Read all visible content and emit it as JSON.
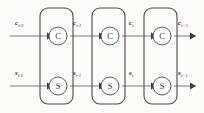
{
  "figure": {
    "type": "unrolled-recurrent-network-diagram",
    "background_color": "#fbfbfa",
    "stroke_color": "#4a4a4a",
    "wire_color": "#7d7d7d",
    "label_color": "#1c1c1c"
  },
  "blocks": [
    {
      "id": "timestep-block-1",
      "nodes": [
        {
          "id": "c-node-1",
          "label": "C",
          "row": "top"
        },
        {
          "id": "s-node-1",
          "label": "S",
          "row": "bottom"
        }
      ]
    },
    {
      "id": "timestep-block-2",
      "nodes": [
        {
          "id": "c-node-2",
          "label": "C",
          "row": "top"
        },
        {
          "id": "s-node-2",
          "label": "S",
          "row": "bottom"
        }
      ]
    },
    {
      "id": "timestep-block-3",
      "nodes": [
        {
          "id": "c-node-3",
          "label": "C",
          "row": "top"
        },
        {
          "id": "s-node-3",
          "label": "S",
          "row": "bottom"
        }
      ]
    }
  ],
  "labels": {
    "top_row": [
      {
        "id": "c-label-0",
        "base": "c",
        "sub": "t-2"
      },
      {
        "id": "c-label-1",
        "base": "c",
        "sub": "t-1"
      },
      {
        "id": "c-label-2",
        "base": "c",
        "sub": "t"
      },
      {
        "id": "c-label-3",
        "base": "c",
        "sub": "t+1"
      }
    ],
    "bottom_row": [
      {
        "id": "s-label-0",
        "base": "s",
        "sub": "t-2"
      },
      {
        "id": "s-label-1",
        "base": "s",
        "sub": "t-1"
      },
      {
        "id": "s-label-2",
        "base": "s",
        "sub": "t"
      },
      {
        "id": "s-label-3",
        "base": "s",
        "sub": "t+1"
      }
    ]
  },
  "node_labels": {
    "c": "C",
    "s": "S"
  }
}
